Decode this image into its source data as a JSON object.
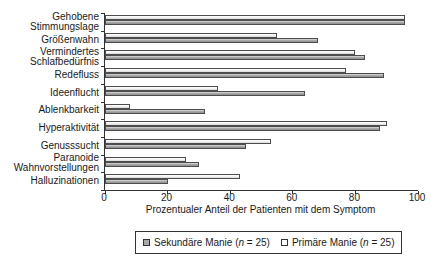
{
  "chart_data": {
    "type": "bar",
    "orientation": "horizontal",
    "title": "",
    "xlabel": "Prozentualer Anteil der Patienten mit dem Symptom",
    "xlim": [
      0,
      100
    ],
    "xticks": [
      "0",
      "20",
      "40",
      "60",
      "80",
      "100"
    ],
    "grid": false,
    "categories": [
      "Gehobene\nStimmungslage",
      "Größenwahn",
      "Vermindertes\nSchlafbedürfnis",
      "Redefluss",
      "Ideenflucht",
      "Ablenkbarkeit",
      "Hyperaktivität",
      "Genusssucht",
      "Paranoide\nWahnvorstellungen",
      "Halluzinationen"
    ],
    "series": [
      {
        "name": "Primäre Manie (n = 25)",
        "pair_position": "top",
        "style": "primaer",
        "values": [
          96,
          55,
          80,
          77,
          36,
          8,
          90,
          53,
          26,
          43
        ]
      },
      {
        "name": "Sekundäre Manie (n = 25)",
        "pair_position": "bottom",
        "style": "sekundaer",
        "values": [
          96,
          68,
          83,
          89,
          64,
          32,
          88,
          45,
          30,
          20
        ]
      }
    ],
    "legend": {
      "position": "bottom",
      "border": true,
      "items": [
        {
          "label_pre": "Sekundäre Manie (",
          "label_n": "n",
          "label_post": " = 25)",
          "swatch": "sekundaer"
        },
        {
          "label_pre": "Primäre Manie (",
          "label_n": "n",
          "label_post": " = 25)",
          "swatch": "primaer"
        }
      ]
    }
  },
  "colors": {
    "background": "#ffffff",
    "axis": "#333333",
    "text": "#1a1a1a",
    "bar_border": "#4d4d4d",
    "primaer_fill": "#f1f1f1",
    "sekundaer_fill": "#a8a8a8"
  }
}
